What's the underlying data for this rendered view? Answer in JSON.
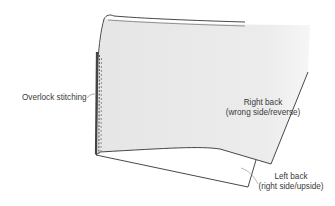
{
  "diagram": {
    "type": "garment-construction-illustration",
    "colors": {
      "fabric_wrong_side": "#e9e9e9",
      "outline": "#333333",
      "stitching": "#555555",
      "leader_line": "#777777",
      "text": "#3a3a3a"
    },
    "labels": {
      "overlock": "Overlock stitching",
      "right_back_line1": "Right back",
      "right_back_line2": "(wrong side/reverse)",
      "left_back_line1": "Left back",
      "left_back_line2": "(right side/upside)"
    }
  }
}
